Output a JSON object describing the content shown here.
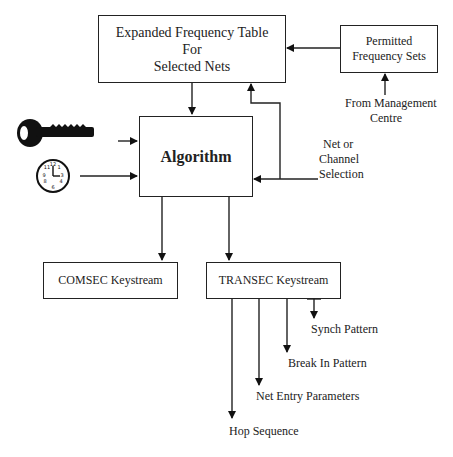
{
  "diagram": {
    "nodes": {
      "freq_table": {
        "line1": "Expanded Frequency Table",
        "line2": "For",
        "line3": "Selected Nets"
      },
      "permitted": {
        "line1": "Permitted",
        "line2": "Frequency Sets"
      },
      "algorithm": {
        "label": "Algorithm"
      },
      "comsec": {
        "label": "COMSEC Keystream"
      },
      "transec": {
        "label": "TRANSEC Keystream"
      }
    },
    "labels": {
      "mgmt_line1": "From Management",
      "mgmt_line2": "Centre",
      "net_line1": "Net or",
      "net_line2": "Channel",
      "net_line3": "Selection",
      "synch": "Synch Pattern",
      "break_in": "Break In Pattern",
      "net_entry": "Net Entry Parameters",
      "hop": "Hop Sequence"
    },
    "icons": [
      "key-icon",
      "clock-icon"
    ]
  }
}
